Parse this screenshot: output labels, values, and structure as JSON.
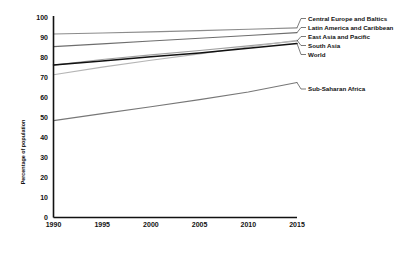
{
  "chart_data": {
    "type": "line",
    "title": "",
    "subtitle": "",
    "xlabel": "",
    "ylabel": "Percentage of population",
    "xlim": [
      1990,
      2015
    ],
    "ylim": [
      0,
      100
    ],
    "grid": false,
    "legend_position": "right-inline-labels",
    "x": [
      1990,
      1995,
      2000,
      2005,
      2010,
      2015
    ],
    "xticks": [
      "1990",
      "1995",
      "2000",
      "2005",
      "2010",
      "2015"
    ],
    "yticks": [
      "0",
      "10",
      "20",
      "30",
      "40",
      "50",
      "60",
      "70",
      "80",
      "90",
      "100"
    ],
    "series": [
      {
        "name": "Central Europe and Baltics",
        "color": "#8c8c8c",
        "width": 1.1,
        "values": [
          91.5,
          92.0,
          92.6,
          93.2,
          93.9,
          94.6
        ]
      },
      {
        "name": "Latin America and Caribbean",
        "color": "#6e6e6e",
        "width": 1.1,
        "values": [
          85.2,
          86.6,
          88.0,
          89.4,
          90.8,
          92.2
        ]
      },
      {
        "name": "East Asia and Pacific",
        "color": "#a0a0a0",
        "width": 1.1,
        "values": [
          76.0,
          78.8,
          81.1,
          83.3,
          85.6,
          88.0
        ]
      },
      {
        "name": "South Asia",
        "color": "#b5b5b5",
        "width": 1.1,
        "values": [
          71.2,
          75.0,
          78.4,
          81.6,
          85.0,
          88.4
        ]
      },
      {
        "name": "World",
        "color": "#111111",
        "width": 1.5,
        "values": [
          76.1,
          78.0,
          80.2,
          82.1,
          84.4,
          86.8
        ]
      },
      {
        "name": "Sub-Saharan Africa",
        "color": "#777777",
        "width": 1.1,
        "values": [
          48.3,
          51.8,
          55.2,
          58.8,
          62.6,
          67.3
        ]
      }
    ],
    "callout_labels": [
      {
        "name": "Central Europe and Baltics",
        "label_y": 18.5
      },
      {
        "name": "Latin America and Caribbean",
        "label_y": 27.5
      },
      {
        "name": "East Asia and Pacific",
        "label_y": 36.5
      },
      {
        "name": "South Asia",
        "label_y": 45.5
      },
      {
        "name": "World",
        "label_y": 54.5
      },
      {
        "name": "Sub-Saharan Africa",
        "label_y": 89.0
      }
    ]
  },
  "axis": {
    "y_title": "Percentage of population",
    "axis_color": "#111111"
  }
}
